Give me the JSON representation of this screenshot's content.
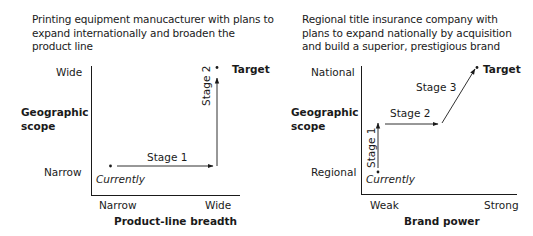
{
  "left": {
    "caption": [
      "Printing equipment manucacturer with plans to",
      "expand internationally and broaden the",
      "product line"
    ],
    "y_axis": {
      "title": [
        "Geographic",
        "scope"
      ],
      "high": "Wide",
      "low": "Narrow"
    },
    "x_axis": {
      "title": "Product-line breadth",
      "low": "Narrow",
      "high": "Wide"
    },
    "current_label": "Currently",
    "target_label": "Target",
    "stages": [
      {
        "label": "Stage 1",
        "from": [
          "Narrow",
          "Narrow"
        ],
        "to": [
          "Wide",
          "Narrow"
        ]
      },
      {
        "label": "Stage 2",
        "from": [
          "Wide",
          "Narrow"
        ],
        "to": [
          "Wide",
          "Wide"
        ]
      }
    ]
  },
  "right": {
    "caption": [
      "Regional title insurance company with",
      "plans to expand nationally by acquisition",
      "and build a superior, prestigious brand"
    ],
    "y_axis": {
      "title": [
        "Geographic",
        "scope"
      ],
      "high": "National",
      "low": "Regional"
    },
    "x_axis": {
      "title": "Brand power",
      "low": "Weak",
      "high": "Strong"
    },
    "current_label": "Currently",
    "target_label": "Target",
    "stages": [
      {
        "label": "Stage 1",
        "direction": "up (geographic scope)"
      },
      {
        "label": "Stage 2",
        "direction": "right (brand power)"
      },
      {
        "label": "Stage 3",
        "direction": "diagonal to target"
      }
    ]
  },
  "colors": {
    "ink": "#1a1a1a",
    "background": "#ffffff"
  }
}
